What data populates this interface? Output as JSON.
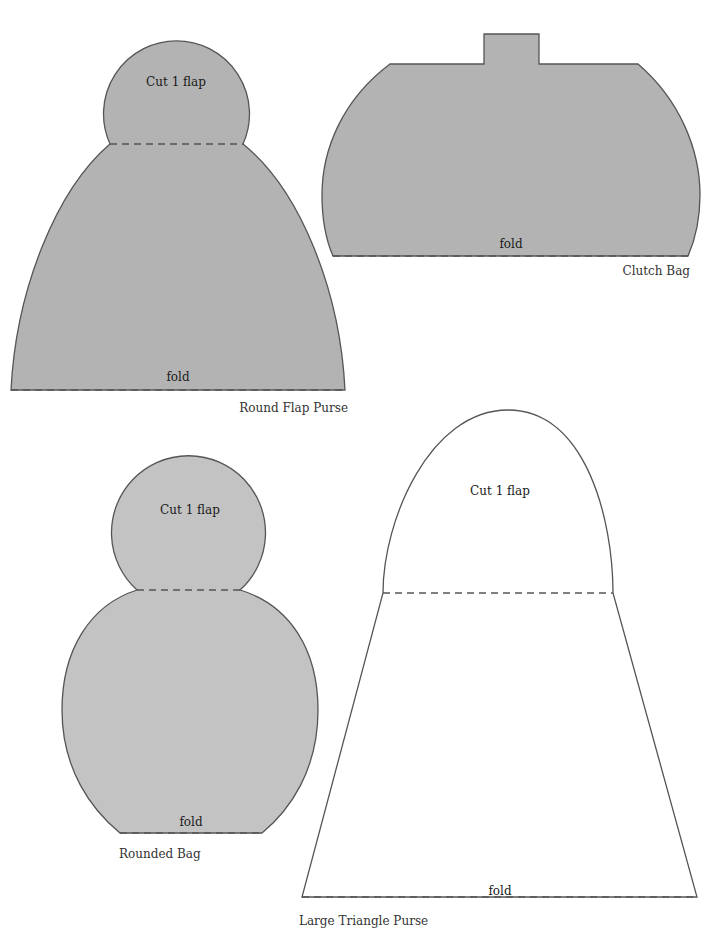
{
  "page": {
    "colors": {
      "dark_fill": "#b3b3b3",
      "light_fill": "#c3c3c3",
      "outline": "#555555",
      "background": "#ffffff"
    }
  },
  "patterns": [
    {
      "name": "Round Flap Purse",
      "flap_label": "Cut 1 flap",
      "fold_label": "fold",
      "caption": "Round Flap Purse"
    },
    {
      "name": "Clutch Bag",
      "fold_label": "fold",
      "caption": "Clutch Bag"
    },
    {
      "name": "Rounded Bag",
      "flap_label": "Cut 1 flap",
      "fold_label": "fold",
      "caption": "Rounded Bag"
    },
    {
      "name": "Large Triangle Purse",
      "flap_label": "Cut 1 flap",
      "fold_label": "fold",
      "caption": "Large Triangle Purse"
    }
  ]
}
